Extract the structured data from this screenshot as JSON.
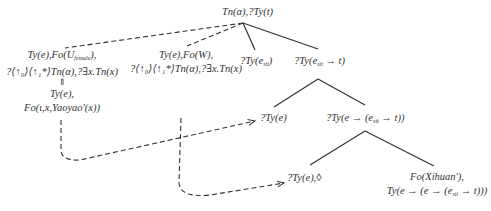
{
  "diagram": {
    "type": "dynamic-syntax-tree",
    "root": {
      "label": "Tn(α),?Ty(t)"
    },
    "unfixed_nodes": [
      {
        "id": "female-node",
        "lines": [
          "Ty(e),Fo(U",
          "female",
          "),",
          "?⟨↑₀⟩⟨↑₁*⟩Tn(α),?∃x.Tn(x)"
        ],
        "line1_pre": "Ty(e),Fo(U",
        "line1_sub": "female",
        "line1_post": "),",
        "line2": "?⟨↑₀⟩⟨↑₁*⟩Tn(α),?∃x.Tn(x)"
      },
      {
        "id": "w-node",
        "line1": "Ty(e),Fo(W),",
        "line2": "?⟨↑₀⟩⟨↑₁*⟩Tn(α),?∃x.Tn(x)"
      }
    ],
    "linked_node": {
      "arrow": "⇑",
      "line1": "Ty(e),",
      "line2": "Fo(ι,x,Yaoyao'(x))"
    },
    "children": {
      "event_node": {
        "pre": "?Ty(e",
        "sub": "sit",
        "post": ")"
      },
      "predicate_node": {
        "pre": "?Ty(e",
        "sub": "sit",
        "post": " → t)"
      },
      "subject_node": {
        "label": "?Ty(e)"
      },
      "verb_phrase_node": {
        "pre": "?Ty(e → (e",
        "sub": "sit",
        "post": " → t))"
      },
      "object_node": {
        "label": "?Ty(e),◊"
      },
      "verb_node": {
        "line1": "Fo(Xihuan'),",
        "line2_pre": "Ty(e → (e → (e",
        "line2_sub": "sit",
        "line2_post": " → t)))"
      }
    },
    "colors": {
      "text": "#333333",
      "edge": "#333333",
      "dashed": "#333333",
      "background": "#ffffff"
    }
  }
}
